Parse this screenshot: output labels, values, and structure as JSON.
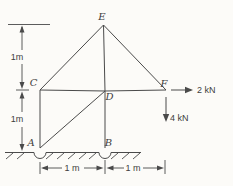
{
  "figure": {
    "ink_color": "#4a4a4a",
    "background_color": "#fcfbf8",
    "nodes": [
      {
        "id": "E",
        "x": 103.5,
        "y": 25,
        "label_x": 102,
        "label_y": 20
      },
      {
        "id": "C",
        "x": 40,
        "y": 90,
        "label_x": 33.5,
        "label_y": 86
      },
      {
        "id": "D",
        "x": 105,
        "y": 91,
        "label_x": 109.5,
        "label_y": 100
      },
      {
        "id": "F",
        "x": 166,
        "y": 90,
        "label_x": 164,
        "label_y": 87
      },
      {
        "id": "A",
        "x": 40,
        "y": 148,
        "label_x": 31,
        "label_y": 146
      },
      {
        "id": "B",
        "x": 105,
        "y": 148,
        "label_x": 108.5,
        "label_y": 146
      }
    ],
    "members": [
      {
        "from": "E",
        "to": "C"
      },
      {
        "from": "E",
        "to": "D"
      },
      {
        "from": "E",
        "to": "F"
      },
      {
        "from": "C",
        "to": "D"
      },
      {
        "from": "D",
        "to": "F"
      },
      {
        "from": "C",
        "to": "A"
      },
      {
        "from": "A",
        "to": "D"
      },
      {
        "from": "D",
        "to": "B"
      }
    ],
    "forces": [
      {
        "label": "2 kN",
        "dir": "right",
        "shaft": [
          171,
          90,
          186,
          90
        ],
        "tip": [
          193,
          90
        ],
        "label_x": 197,
        "label_y": 93,
        "anchor": "start"
      },
      {
        "label": "4 kN",
        "dir": "down",
        "shaft": [
          166,
          97,
          166,
          115
        ],
        "tip": [
          166,
          122
        ],
        "label_x": 170,
        "label_y": 121,
        "anchor": "start"
      }
    ],
    "dimensions": {
      "lines": [
        [
          8,
          24.5,
          50,
          24.5
        ],
        [
          22,
          27,
          22,
          50
        ],
        [
          22,
          64,
          22,
          86
        ],
        [
          16,
          90,
          29,
          90
        ],
        [
          22,
          94,
          22,
          112
        ],
        [
          22,
          127,
          22,
          147
        ],
        [
          40,
          162,
          40,
          174
        ],
        [
          105,
          160,
          105,
          174
        ],
        [
          165,
          160,
          165,
          174
        ],
        [
          43,
          168,
          62,
          168
        ],
        [
          84,
          168,
          101,
          168
        ],
        [
          109,
          168,
          124,
          168
        ],
        [
          143,
          168,
          161,
          168
        ]
      ],
      "arrows": [
        {
          "x": 22,
          "y": 25.5,
          "dir": "up"
        },
        {
          "x": 22,
          "y": 89,
          "dir": "down"
        },
        {
          "x": 22,
          "y": 91.5,
          "dir": "up"
        },
        {
          "x": 22,
          "y": 151,
          "dir": "down"
        },
        {
          "x": 41,
          "y": 168,
          "dir": "left"
        },
        {
          "x": 103.5,
          "y": 168,
          "dir": "right"
        },
        {
          "x": 106.5,
          "y": 168,
          "dir": "left"
        },
        {
          "x": 164,
          "y": 168,
          "dir": "right"
        }
      ],
      "labels": [
        {
          "text": "1m",
          "x": 17,
          "y": 60
        },
        {
          "text": "1m",
          "x": 17,
          "y": 122
        },
        {
          "text": "1 m",
          "x": 72,
          "y": 171
        },
        {
          "text": "1 m",
          "x": 133,
          "y": 171
        }
      ]
    },
    "ground": {
      "y": 152.5,
      "segments": [
        [
          5,
          34
        ],
        [
          46,
          99
        ],
        [
          111,
          141
        ]
      ],
      "support_notches": [
        {
          "at_node": "A",
          "cx": 40,
          "r": 6
        },
        {
          "at_node": "B",
          "cx": 105,
          "r": 6
        }
      ],
      "hatches_x": [
        13,
        24,
        53,
        64,
        75,
        86,
        96,
        118,
        129,
        140
      ]
    }
  }
}
